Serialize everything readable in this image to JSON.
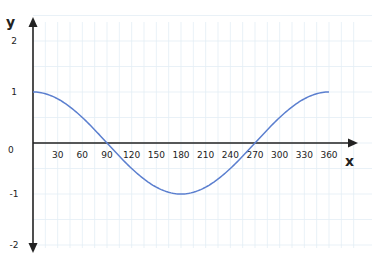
{
  "chart_data": {
    "type": "line",
    "title": "",
    "xlabel": "x",
    "ylabel": "y",
    "xlim": [
      0,
      360
    ],
    "ylim": [
      -2,
      2
    ],
    "grid": true,
    "legend": null,
    "x_ticks": [
      30,
      60,
      90,
      120,
      150,
      180,
      210,
      240,
      270,
      300,
      330,
      360
    ],
    "y_ticks": [
      2,
      1,
      0,
      -1,
      -2
    ],
    "origin_label": "0",
    "series": [
      {
        "name": "y = cos(x)",
        "color": "#5b7fcf",
        "x": [
          0,
          30,
          60,
          90,
          120,
          150,
          180,
          210,
          240,
          270,
          300,
          330,
          360
        ],
        "values": [
          1,
          0.87,
          0.5,
          0,
          -0.5,
          -0.87,
          -1,
          -0.87,
          -0.5,
          0,
          0.5,
          0.87,
          1
        ]
      }
    ]
  },
  "colors": {
    "grid": "#e3eef5",
    "axis": "#222222",
    "curve": "#5b7fcf"
  }
}
